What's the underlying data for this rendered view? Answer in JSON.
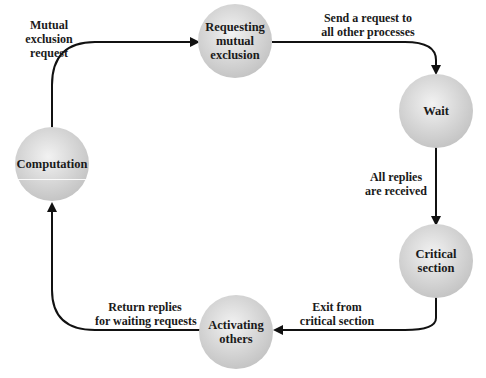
{
  "diagram": {
    "type": "state-cycle",
    "nodes": [
      {
        "id": "requesting",
        "line1": "Requesting",
        "line2": "mutual",
        "line3": "exclusion"
      },
      {
        "id": "wait",
        "line1": "Wait"
      },
      {
        "id": "critical",
        "line1": "Critical",
        "line2": "section"
      },
      {
        "id": "activating",
        "line1": "Activating",
        "line2": "others"
      },
      {
        "id": "computation",
        "line1": "Computation"
      }
    ],
    "edges": [
      {
        "from": "computation",
        "to": "requesting",
        "line1": "Mutual",
        "line2": "exclusion",
        "line3": "request"
      },
      {
        "from": "requesting",
        "to": "wait",
        "line1": "Send a request to",
        "line2": "all other processes"
      },
      {
        "from": "wait",
        "to": "critical",
        "line1": "All replies",
        "line2": "are received"
      },
      {
        "from": "critical",
        "to": "activating",
        "line1": "Exit from",
        "line2": "critical section"
      },
      {
        "from": "activating",
        "to": "computation",
        "line1": "Return replies",
        "line2": "for waiting requests"
      }
    ]
  }
}
